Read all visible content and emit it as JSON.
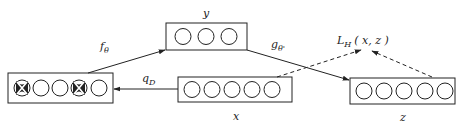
{
  "diagram": {
    "type": "denoising-autoencoder",
    "nodes": {
      "corrupted": {
        "label": "",
        "units": 5,
        "dropped_units": [
          0,
          3
        ]
      },
      "input": {
        "label": "x",
        "units": 5
      },
      "hidden": {
        "label": "y",
        "units": 3
      },
      "reconstruction": {
        "label": "z",
        "units": 5
      }
    },
    "edges": {
      "corruption": {
        "label_main": "q",
        "label_sub": "D",
        "from": "input",
        "to": "corrupted"
      },
      "encoder": {
        "label_main": "f",
        "label_sub": "θ",
        "from": "corrupted",
        "to": "hidden"
      },
      "decoder": {
        "label_main": "g",
        "label_sub": "θ'",
        "from": "hidden",
        "to": "reconstruction"
      }
    },
    "loss": {
      "label_main": "L",
      "label_sub": "H",
      "label_args": "( x,  z )",
      "style": "dashed",
      "inputs": [
        "input",
        "reconstruction"
      ]
    },
    "colors": {
      "stroke": "#222222",
      "background": "#ffffff",
      "dropped_fill": "#222222"
    }
  }
}
